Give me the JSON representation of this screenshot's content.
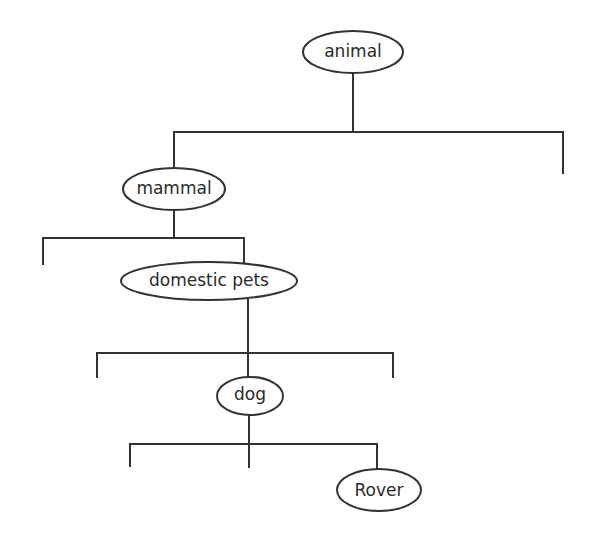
{
  "diagram": {
    "type": "tree",
    "colors": {
      "stroke": "#333333",
      "text": "#2a2a2a",
      "background": "#ffffff"
    },
    "nodes": [
      {
        "id": "animal",
        "label": "animal",
        "cx": 353,
        "cy": 52,
        "rx": 50,
        "ry": 21
      },
      {
        "id": "mammal",
        "label": "mammal",
        "cx": 174,
        "cy": 189,
        "rx": 51,
        "ry": 21
      },
      {
        "id": "domestic-pets",
        "label": "domestic pets",
        "cx": 209,
        "cy": 281,
        "rx": 88,
        "ry": 19
      },
      {
        "id": "dog",
        "label": "dog",
        "cx": 250,
        "cy": 396,
        "rx": 33,
        "ry": 19
      },
      {
        "id": "rover",
        "label": "Rover",
        "cx": 379,
        "cy": 490,
        "rx": 42,
        "ry": 21
      }
    ],
    "edges": [
      {
        "from": "animal",
        "stem": [
          353,
          73,
          353,
          132
        ],
        "bar": [
          174,
          132,
          563,
          132
        ],
        "drops": [
          [
            174,
            132,
            174,
            168
          ],
          [
            563,
            132,
            563,
            173
          ]
        ]
      },
      {
        "from": "mammal",
        "stem": [
          174,
          210,
          174,
          238
        ],
        "bar": [
          43,
          238,
          244,
          238
        ],
        "drops": [
          [
            43,
            238,
            43,
            264
          ],
          [
            244,
            238,
            244,
            263
          ]
        ]
      },
      {
        "from": "domestic-pets",
        "stem": [
          248,
          300,
          248,
          353
        ],
        "bar": [
          97,
          353,
          393,
          353
        ],
        "drops": [
          [
            97,
            353,
            97,
            377
          ],
          [
            248,
            353,
            248,
            377
          ],
          [
            393,
            353,
            393,
            377
          ]
        ]
      },
      {
        "from": "dog",
        "stem": [
          249,
          415,
          249,
          444
        ],
        "bar": [
          130,
          444,
          377,
          444
        ],
        "drops": [
          [
            130,
            444,
            130,
            466
          ],
          [
            249,
            444,
            249,
            467
          ],
          [
            377,
            444,
            377,
            469
          ]
        ]
      }
    ]
  }
}
